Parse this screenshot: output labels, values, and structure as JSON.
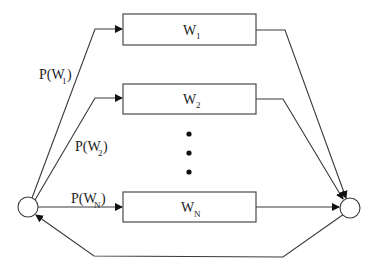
{
  "diagram": {
    "type": "parallel-branch flow diagram",
    "nodes": {
      "source": {
        "shape": "circle",
        "label": ""
      },
      "sink": {
        "shape": "circle",
        "label": ""
      }
    },
    "branches": [
      {
        "box_label": "W",
        "box_sub": "1",
        "prob_label": "P(W",
        "prob_sub": "1",
        "prob_close": ")"
      },
      {
        "box_label": "W",
        "box_sub": "2",
        "prob_label": "P(W",
        "prob_sub": "2",
        "prob_close": ")"
      },
      {
        "box_label": "W",
        "box_sub": "N",
        "prob_label": "P(W",
        "prob_sub": "N",
        "prob_close": ")"
      }
    ],
    "ellipsis": "vertical dots (branches 3..N-1 omitted)",
    "feedback": "arrow from sink circle back to source circle",
    "colors": {
      "stroke": "#3a3a3a",
      "background": "#ffffff",
      "text": "#222222"
    }
  }
}
